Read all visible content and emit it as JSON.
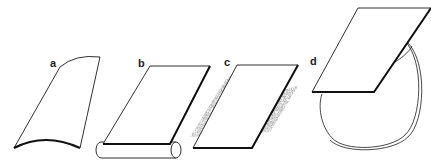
{
  "figure": {
    "panels": [
      {
        "id": "a",
        "label": "a",
        "description": "curved sheet"
      },
      {
        "id": "b",
        "label": "b",
        "description": "flat sheet on cylinder"
      },
      {
        "id": "c",
        "label": "c",
        "description": "flat sheet with stippled edges"
      },
      {
        "id": "d",
        "label": "d",
        "description": "flat sheet on rounded bag"
      }
    ],
    "colors": {
      "stroke": "#1a1a1a",
      "stipple": "#888888",
      "background": "#ffffff"
    }
  }
}
